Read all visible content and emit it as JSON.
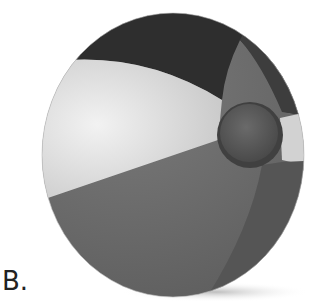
{
  "figure": {
    "label": "B.",
    "colors": {
      "background": "#ffffff",
      "panel_dark": "#2e2e2e",
      "panel_light": "#dcdcdc",
      "panel_medium": "#6e6e6e",
      "panel_right_dark": "#555555",
      "valve": "#5a5a5a",
      "shadow": "#d6d6d6"
    }
  }
}
